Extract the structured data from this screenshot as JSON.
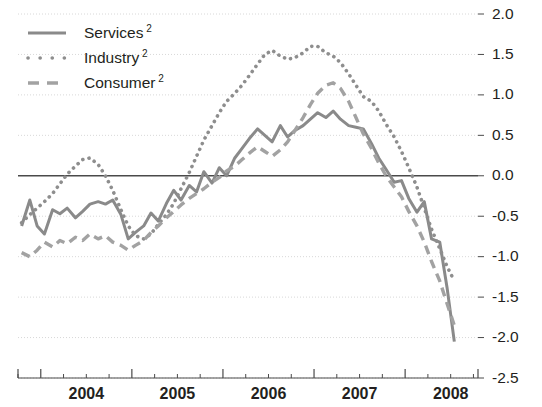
{
  "chart_data": {
    "type": "line",
    "title": "",
    "subtitle": "",
    "xlabel": "",
    "ylabel": "",
    "ylim": [
      -2.5,
      2.0
    ],
    "ytick_labels": [
      "2.0",
      "1.5",
      "1.0",
      "0.5",
      "0.0",
      "-0.5",
      "-1.0",
      "-1.5",
      "-2.0",
      "-2.5"
    ],
    "ytick_values": [
      2.0,
      1.5,
      1.0,
      0.5,
      0.0,
      -0.5,
      -1.0,
      -1.5,
      -2.0,
      -2.5
    ],
    "y_axis_position": "right",
    "grid": true,
    "zero_line": true,
    "xtick_labels": [
      "2004",
      "2005",
      "2006",
      "2007",
      "2008"
    ],
    "xtick_values": [
      2004,
      2005,
      2006,
      2007,
      2008
    ],
    "xlim": [
      2003.75,
      2008.8
    ],
    "minor_ticks_per_year": 4,
    "legend_position": "top-left",
    "series": [
      {
        "name": "Services ²",
        "label": "Services",
        "footnote_marker": "2",
        "style": "solid",
        "color": "#8a8a8a",
        "x": [
          2003.79,
          2003.88,
          2003.96,
          2004.04,
          2004.13,
          2004.21,
          2004.29,
          2004.38,
          2004.46,
          2004.54,
          2004.63,
          2004.71,
          2004.79,
          2004.88,
          2004.96,
          2005.04,
          2005.13,
          2005.21,
          2005.29,
          2005.38,
          2005.46,
          2005.54,
          2005.63,
          2005.71,
          2005.79,
          2005.88,
          2005.96,
          2006.04,
          2006.13,
          2006.21,
          2006.29,
          2006.38,
          2006.46,
          2006.54,
          2006.63,
          2006.71,
          2006.79,
          2006.88,
          2006.96,
          2007.04,
          2007.13,
          2007.21,
          2007.29,
          2007.38,
          2007.46,
          2007.54,
          2007.63,
          2007.71,
          2007.79,
          2007.88,
          2007.96,
          2008.04,
          2008.13,
          2008.21,
          2008.29,
          2008.38,
          2008.46,
          2008.54
        ],
        "values": [
          -0.62,
          -0.3,
          -0.62,
          -0.72,
          -0.42,
          -0.47,
          -0.4,
          -0.52,
          -0.44,
          -0.35,
          -0.32,
          -0.35,
          -0.3,
          -0.48,
          -0.78,
          -0.7,
          -0.62,
          -0.46,
          -0.56,
          -0.34,
          -0.18,
          -0.3,
          -0.12,
          -0.2,
          0.05,
          -0.09,
          0.1,
          0.0,
          0.22,
          0.34,
          0.46,
          0.58,
          0.5,
          0.42,
          0.62,
          0.48,
          0.56,
          0.62,
          0.7,
          0.78,
          0.72,
          0.8,
          0.7,
          0.62,
          0.6,
          0.58,
          0.4,
          0.22,
          0.08,
          -0.08,
          -0.06,
          -0.28,
          -0.45,
          -0.32,
          -0.78,
          -0.82,
          -1.38,
          -2.05
        ]
      },
      {
        "name": "Industry ²",
        "label": "Industry",
        "footnote_marker": "2",
        "style": "dotted",
        "color": "#8e8e8e",
        "x": [
          2003.79,
          2003.88,
          2003.96,
          2004.04,
          2004.13,
          2004.21,
          2004.29,
          2004.38,
          2004.46,
          2004.54,
          2004.63,
          2004.71,
          2004.79,
          2004.88,
          2004.96,
          2005.04,
          2005.13,
          2005.21,
          2005.29,
          2005.38,
          2005.46,
          2005.54,
          2005.63,
          2005.71,
          2005.79,
          2005.88,
          2005.96,
          2006.04,
          2006.13,
          2006.21,
          2006.29,
          2006.38,
          2006.46,
          2006.54,
          2006.63,
          2006.71,
          2006.79,
          2006.88,
          2006.96,
          2007.04,
          2007.13,
          2007.21,
          2007.29,
          2007.38,
          2007.46,
          2007.54,
          2007.63,
          2007.71,
          2007.79,
          2007.88,
          2007.96,
          2008.04,
          2008.13,
          2008.21,
          2008.29,
          2008.38,
          2008.46,
          2008.54
        ],
        "values": [
          -0.58,
          -0.48,
          -0.4,
          -0.32,
          -0.22,
          -0.1,
          0.02,
          0.12,
          0.2,
          0.22,
          0.14,
          0.0,
          -0.18,
          -0.42,
          -0.62,
          -0.74,
          -0.78,
          -0.72,
          -0.6,
          -0.48,
          -0.34,
          -0.16,
          0.04,
          0.24,
          0.44,
          0.62,
          0.78,
          0.92,
          1.02,
          1.12,
          1.24,
          1.38,
          1.5,
          1.55,
          1.48,
          1.44,
          1.46,
          1.52,
          1.6,
          1.6,
          1.52,
          1.48,
          1.4,
          1.26,
          1.12,
          0.98,
          0.92,
          0.8,
          0.64,
          0.48,
          0.3,
          0.1,
          -0.14,
          -0.4,
          -0.66,
          -0.9,
          -1.12,
          -1.3
        ]
      },
      {
        "name": "Consumer ²",
        "label": "Consumer",
        "footnote_marker": "2",
        "style": "dashed",
        "color": "#a2a2a2",
        "x": [
          2003.79,
          2003.88,
          2003.96,
          2004.04,
          2004.13,
          2004.21,
          2004.29,
          2004.38,
          2004.46,
          2004.54,
          2004.63,
          2004.71,
          2004.79,
          2004.88,
          2004.96,
          2005.04,
          2005.13,
          2005.21,
          2005.29,
          2005.38,
          2005.46,
          2005.54,
          2005.63,
          2005.71,
          2005.79,
          2005.88,
          2005.96,
          2006.04,
          2006.13,
          2006.21,
          2006.29,
          2006.38,
          2006.46,
          2006.54,
          2006.63,
          2006.71,
          2006.79,
          2006.88,
          2006.96,
          2007.04,
          2007.13,
          2007.21,
          2007.29,
          2007.38,
          2007.46,
          2007.54,
          2007.63,
          2007.71,
          2007.79,
          2007.88,
          2007.96,
          2008.04,
          2008.13,
          2008.21,
          2008.29,
          2008.38,
          2008.46,
          2008.54
        ],
        "values": [
          -0.95,
          -1.0,
          -0.92,
          -0.82,
          -0.88,
          -0.8,
          -0.84,
          -0.76,
          -0.8,
          -0.72,
          -0.78,
          -0.74,
          -0.82,
          -0.86,
          -0.92,
          -0.86,
          -0.8,
          -0.7,
          -0.62,
          -0.52,
          -0.44,
          -0.36,
          -0.28,
          -0.22,
          -0.16,
          -0.08,
          -0.02,
          0.06,
          0.12,
          0.2,
          0.28,
          0.36,
          0.3,
          0.24,
          0.32,
          0.42,
          0.56,
          0.72,
          0.88,
          1.02,
          1.12,
          1.15,
          1.08,
          0.92,
          0.72,
          0.52,
          0.34,
          0.16,
          0.0,
          -0.14,
          -0.26,
          -0.44,
          -0.62,
          -0.82,
          -1.06,
          -1.3,
          -1.58,
          -1.85
        ]
      }
    ]
  },
  "legend": {
    "items": [
      {
        "label": "Services",
        "marker": "2",
        "style": "solid"
      },
      {
        "label": "Industry",
        "marker": "2",
        "style": "dotted"
      },
      {
        "label": "Consumer",
        "marker": "2",
        "style": "dashed"
      }
    ]
  },
  "colors": {
    "services": "#8a8a8a",
    "industry": "#8e8e8e",
    "consumer": "#a2a2a2",
    "axis": "#4a4a4a",
    "grid": "#d8d8d8",
    "text": "#231f20"
  }
}
